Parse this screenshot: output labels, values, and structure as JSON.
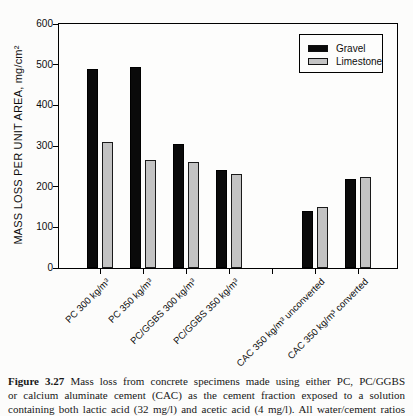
{
  "figure": {
    "caption": {
      "label": "Figure 3.27",
      "line1_rest": "Mass loss from concrete specimens made using either PC, PC/GGBS",
      "line2": "or calcium aluminate cement (CAC) as the cement fraction exposed to a solution",
      "line3": "containing both lactic acid (32 mg/l) and acetic acid (4 mg/l). All water/cement ratios"
    }
  },
  "chart_data": {
    "type": "bar",
    "title": "",
    "ylabel": "MASS LOSS PER UNIT AREA, mg/cm²",
    "xlabel": "",
    "ylim": [
      0,
      600
    ],
    "yticks": [
      0,
      100,
      200,
      300,
      400,
      500,
      600
    ],
    "grid": false,
    "categories": [
      "PC 300 kg/m³",
      "PC 350 kg/m³",
      "PC/GGBS 300 kg/m³",
      "PC/GGBS 350 kg/m³",
      "CAC 350 kg/m³ unconverted",
      "CAC 350 kg/m³ converted"
    ],
    "category_slot_index": [
      0,
      1,
      2,
      3,
      5,
      6
    ],
    "total_slots": 7,
    "series": [
      {
        "name": "Gravel",
        "color": "#0a0a0a",
        "border": "#000000",
        "values": [
          490,
          495,
          305,
          240,
          140,
          220
        ]
      },
      {
        "name": "Limestone",
        "color": "#c3c3c3",
        "border": "#1a1a1a",
        "values": [
          310,
          265,
          260,
          230,
          150,
          225
        ]
      }
    ],
    "legend": {
      "position": "top-right",
      "border_color": "#000000"
    }
  }
}
